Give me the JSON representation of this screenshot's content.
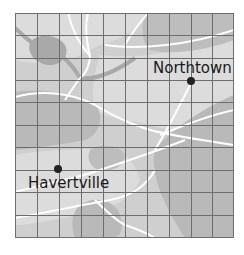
{
  "map": {
    "grid": {
      "cols": 10,
      "rows": 10,
      "x0": 15,
      "y0": 13,
      "x1": 234,
      "y1": 238,
      "line_color": "#6e6e6e"
    },
    "colors": {
      "light": "#dcdcdc",
      "medium": "#c9c9c9",
      "dark": "#b7b7b7",
      "water": "#a9a9a9",
      "road": "#ffffff",
      "city_dot": "#222222"
    },
    "cities": [
      {
        "name": "Northtown",
        "x": 191,
        "y": 81
      },
      {
        "name": "Havertville",
        "x": 58,
        "y": 169
      }
    ]
  }
}
